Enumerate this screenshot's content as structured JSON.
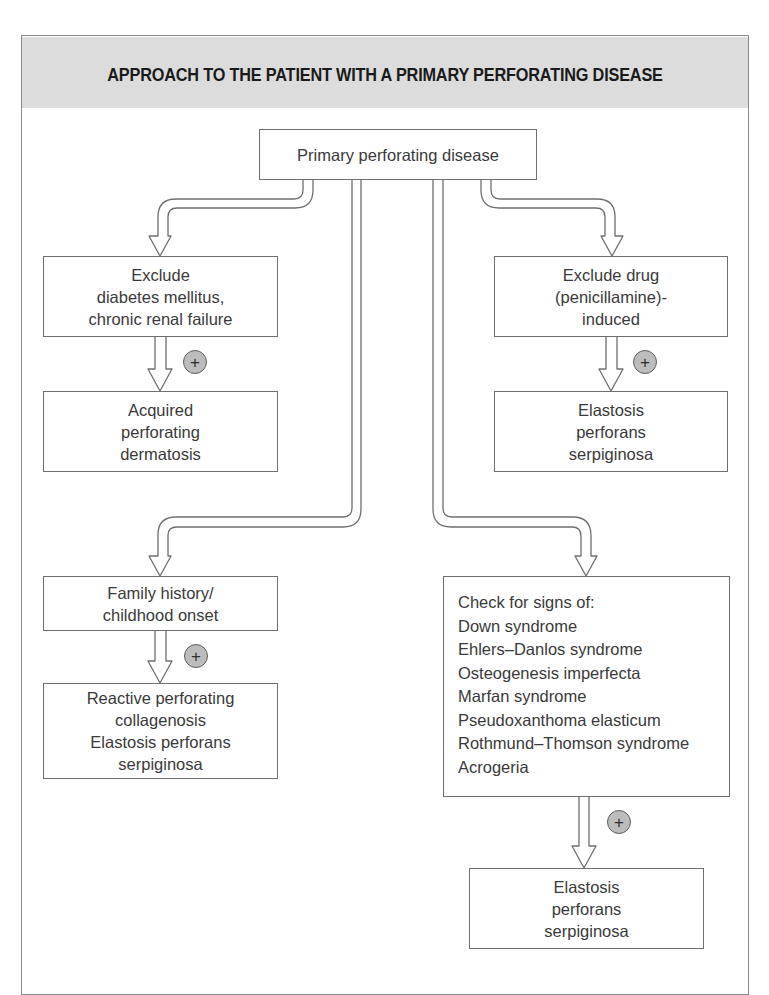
{
  "figure": {
    "title": "APPROACH TO THE PATIENT WITH A PRIMARY PERFORATING DISEASE",
    "colors": {
      "header_band": "#dcdcdc",
      "box_border": "#6f6f6f",
      "badge_fill": "#bcbcbc",
      "text": "#3a3a3a"
    }
  },
  "nodes": {
    "root": {
      "lines": [
        "Primary perforating disease"
      ]
    },
    "left_upper_check": {
      "lines": [
        "Exclude",
        "diabetes mellitus,",
        "chronic renal failure"
      ]
    },
    "left_upper_result": {
      "lines": [
        "Acquired",
        "perforating",
        "dermatosis"
      ]
    },
    "right_upper_check": {
      "lines": [
        "Exclude drug",
        "(penicillamine)-",
        "induced"
      ]
    },
    "right_upper_result": {
      "lines": [
        "Elastosis",
        "perforans",
        "serpiginosa"
      ]
    },
    "left_lower_check": {
      "lines": [
        "Family history/",
        "childhood onset"
      ]
    },
    "left_lower_result": {
      "lines": [
        "Reactive perforating",
        "collagenosis",
        "Elastosis perforans",
        "serpiginosa"
      ]
    },
    "right_lower_check": {
      "lines": [
        "Check for signs of:",
        "Down syndrome",
        "Ehlers–Danlos syndrome",
        "Osteogenesis imperfecta",
        "Marfan syndrome",
        "Pseudoxanthoma elasticum",
        "Rothmund–Thomson syndrome",
        "Acrogeria"
      ]
    },
    "right_lower_result": {
      "lines": [
        "Elastosis",
        "perforans",
        "serpiginosa"
      ]
    }
  },
  "badges": {
    "positive_symbol": "+",
    "icon": "plus-circle-icon"
  },
  "edges": [
    {
      "from": "root",
      "to": "left_upper_check",
      "icon": "pipe-arrow-icon"
    },
    {
      "from": "root",
      "to": "right_upper_check",
      "icon": "pipe-arrow-icon"
    },
    {
      "from": "root",
      "to": "left_lower_check",
      "icon": "pipe-arrow-icon"
    },
    {
      "from": "root",
      "to": "right_lower_check",
      "icon": "pipe-arrow-icon"
    },
    {
      "from": "left_upper_check",
      "to": "left_upper_result",
      "label": "+"
    },
    {
      "from": "right_upper_check",
      "to": "right_upper_result",
      "label": "+"
    },
    {
      "from": "left_lower_check",
      "to": "left_lower_result",
      "label": "+"
    },
    {
      "from": "right_lower_check",
      "to": "right_lower_result",
      "label": "+"
    }
  ]
}
